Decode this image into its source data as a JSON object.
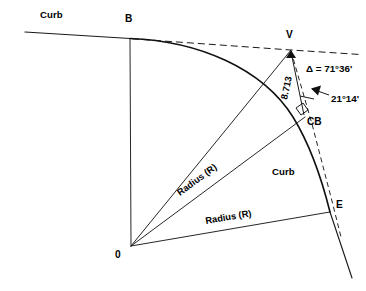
{
  "diagram": {
    "type": "engineering-survey-curve",
    "background_color": "#ffffff",
    "line_color": "#1a1a1a",
    "points": {
      "B": {
        "label": "B",
        "x": 130,
        "y": 38,
        "role": "beginning-of-curve-tangent-point"
      },
      "V": {
        "label": "V",
        "x": 291,
        "y": 50,
        "role": "vertex-point-of-intersection"
      },
      "CB": {
        "label": "CB",
        "x": 305,
        "y": 117,
        "role": "curve-midpoint"
      },
      "E": {
        "label": "E",
        "x": 330,
        "y": 212,
        "role": "end-of-curve"
      },
      "O": {
        "label": "0",
        "x": 131,
        "y": 246,
        "role": "center-of-circle"
      }
    },
    "labels": {
      "curb_top": "Curb",
      "curb_right": "Curb",
      "radius_upper": "Radius (R)",
      "radius_lower": "Radius (R)",
      "offset_dimension": "8.713",
      "delta_angle": "Δ = 71°36'",
      "half_angle": "21°14'"
    },
    "values": {
      "delta_symbol": "Δ",
      "delta_degrees": 71,
      "delta_minutes": 36,
      "delta_text": "71°36'",
      "secondary_angle_degrees": 21,
      "secondary_angle_minutes": 14,
      "secondary_angle_text": "21°14'",
      "external_distance": "8.713",
      "radius_symbol": "R"
    },
    "markers": {
      "right_angle_at_cb": true,
      "arrow_to_half_angle": true,
      "tangent_dashed_through_v": true,
      "back_tangent_dashed_to_e": true
    }
  }
}
